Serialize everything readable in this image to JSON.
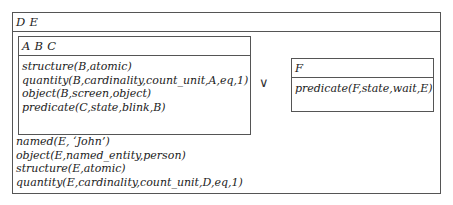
{
  "outer": {
    "header": "D E",
    "conditions": [
      "named(E, ‘John’)",
      "object(E,named_entity,person)",
      "structure(E,atomic)",
      "quantity(E,cardinality,count_unit,D,eq,1)"
    ]
  },
  "left_box": {
    "header": "A B C",
    "conditions": [
      "structure(B,atomic)",
      "quantity(B,cardinality,count_unit,A,eq,1)",
      "object(B,screen,object)",
      "predicate(C,state,blink,B)"
    ]
  },
  "operator": "∨",
  "right_box": {
    "header": "F",
    "conditions": [
      "predicate(F,state,wait,E)"
    ]
  }
}
